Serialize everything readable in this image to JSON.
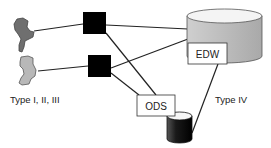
{
  "diagram": {
    "labels": {
      "sources": "Type I, II, III",
      "target_type": "Type IV",
      "edw": "EDW",
      "ods": "ODS"
    },
    "nodes": [
      {
        "id": "source-shape-1",
        "kind": "irregular-shape",
        "fill": "#6f6f6f"
      },
      {
        "id": "source-shape-2",
        "kind": "irregular-shape",
        "fill": "#b8b8b8"
      },
      {
        "id": "process-1",
        "kind": "black-square",
        "fill": "#000000"
      },
      {
        "id": "process-2",
        "kind": "black-square",
        "fill": "#000000"
      },
      {
        "id": "edw-cylinder",
        "kind": "cylinder",
        "fill": "#bdbdbd",
        "label": "EDW"
      },
      {
        "id": "ods-box",
        "kind": "label-box",
        "label": "ODS"
      },
      {
        "id": "ods-cylinder",
        "kind": "cylinder",
        "fill": "#1a1a1a"
      }
    ],
    "edges": [
      {
        "from": "source-shape-1",
        "to": "process-1"
      },
      {
        "from": "source-shape-2",
        "to": "process-2"
      },
      {
        "from": "process-1",
        "to": "edw-cylinder"
      },
      {
        "from": "process-1",
        "to": "ods-box"
      },
      {
        "from": "process-2",
        "to": "edw-cylinder"
      },
      {
        "from": "process-2",
        "to": "ods-box"
      },
      {
        "from": "edw-cylinder",
        "to": "ods-cylinder"
      }
    ]
  }
}
